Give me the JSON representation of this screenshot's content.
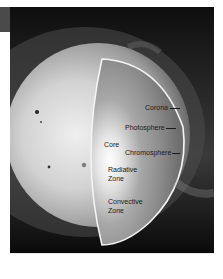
{
  "figure": {
    "labels": {
      "corona": "Corona",
      "photosphere": "Photosphere",
      "core": "Core",
      "chromosphere": "Chromosphere",
      "radiative_zone_line1": "Radiative",
      "radiative_zone_line2": "Zone",
      "convective_zone_line1": "Convective",
      "convective_zone_line2": "Zone"
    },
    "colors": {
      "background": "#ffffff",
      "space": "#111111",
      "outline": "#f4f4f4",
      "label_text": "#1a1a1a"
    }
  }
}
